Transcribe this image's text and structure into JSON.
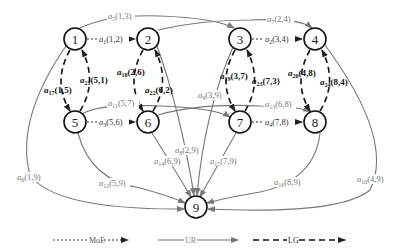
{
  "nodes": [
    {
      "id": "1",
      "x": 75,
      "y": 39
    },
    {
      "id": "2",
      "x": 148,
      "y": 39
    },
    {
      "id": "3",
      "x": 240,
      "y": 39
    },
    {
      "id": "4",
      "x": 315,
      "y": 39
    },
    {
      "id": "5",
      "x": 75,
      "y": 122
    },
    {
      "id": "6",
      "x": 148,
      "y": 122
    },
    {
      "id": "7",
      "x": 240,
      "y": 122
    },
    {
      "id": "8",
      "x": 315,
      "y": 122
    },
    {
      "id": "9",
      "x": 196,
      "y": 207
    }
  ],
  "edges": {
    "moe": [
      {
        "name": "a",
        "sub": "1",
        "pair": "(1,2)"
      },
      {
        "name": "a",
        "sub": "2",
        "pair": "(3,4)"
      },
      {
        "name": "a",
        "sub": "3",
        "pair": "(5,6)"
      },
      {
        "name": "a",
        "sub": "4",
        "pair": "(7,8)"
      }
    ],
    "ur": [
      {
        "name": "a",
        "sub": "5",
        "pair": "(1,3)"
      },
      {
        "name": "a",
        "sub": "6",
        "pair": "(1,9)"
      },
      {
        "name": "a",
        "sub": "7",
        "pair": "(2,4)"
      },
      {
        "name": "a",
        "sub": "8",
        "pair": "(2,9)"
      },
      {
        "name": "a",
        "sub": "9",
        "pair": "(3,9)"
      },
      {
        "name": "a",
        "sub": "10",
        "pair": "(4,9)"
      },
      {
        "name": "a",
        "sub": "11",
        "pair": "(5,7)"
      },
      {
        "name": "a",
        "sub": "12",
        "pair": "(5,9)"
      },
      {
        "name": "a",
        "sub": "13",
        "pair": "(6,8)"
      },
      {
        "name": "a",
        "sub": "14",
        "pair": "(6,9)"
      },
      {
        "name": "a",
        "sub": "15",
        "pair": "(7,9)"
      },
      {
        "name": "a",
        "sub": "16",
        "pair": "(8,9)"
      }
    ],
    "lg": [
      {
        "name": "a",
        "sub": "17",
        "pair": "(1,5)"
      },
      {
        "name": "a",
        "sub": "18",
        "pair": "(2,6)"
      },
      {
        "name": "a",
        "sub": "19",
        "pair": "(3,7)"
      },
      {
        "name": "a",
        "sub": "20",
        "pair": "(4,8)"
      },
      {
        "name": "a",
        "sub": "21",
        "pair": "(5,1)"
      },
      {
        "name": "a",
        "sub": "22",
        "pair": "(6,2)"
      },
      {
        "name": "a",
        "sub": "23",
        "pair": "(7,3)"
      },
      {
        "name": "a",
        "sub": "24",
        "pair": "(8,4)"
      }
    ]
  },
  "legend": {
    "moe": "MoE",
    "ur": "UR",
    "lg": "LG"
  }
}
